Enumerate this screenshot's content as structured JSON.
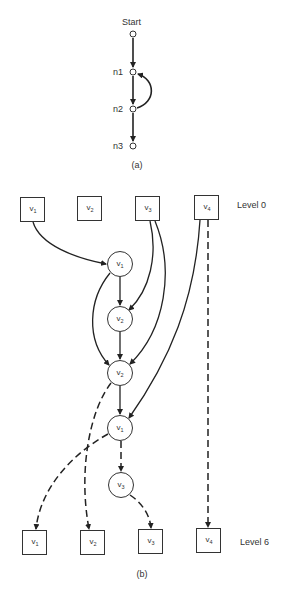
{
  "part_a": {
    "caption": "(a)",
    "nodes": [
      {
        "id": "start",
        "label": "Start",
        "x": 133,
        "y": 34
      },
      {
        "id": "n1",
        "label": "n1",
        "x": 133,
        "y": 72
      },
      {
        "id": "n2",
        "label": "n2",
        "x": 133,
        "y": 109
      },
      {
        "id": "n3",
        "label": "n3",
        "x": 133,
        "y": 146
      }
    ],
    "edges": [
      {
        "from": "start",
        "to": "n1",
        "style": "solid"
      },
      {
        "from": "n1",
        "to": "n2",
        "style": "solid"
      },
      {
        "from": "n2",
        "to": "n1",
        "style": "solid",
        "shape": "arc"
      },
      {
        "from": "n2",
        "to": "n3",
        "style": "solid"
      }
    ]
  },
  "part_b": {
    "caption": "(b)",
    "level_top_label": "Level 0",
    "level_bottom_label": "Level 6",
    "top_boxes": [
      {
        "id": "t1",
        "base": "v",
        "sub": "1"
      },
      {
        "id": "t2",
        "base": "v",
        "sub": "2"
      },
      {
        "id": "t3",
        "base": "v",
        "sub": "3"
      },
      {
        "id": "t4",
        "base": "v",
        "sub": "4"
      }
    ],
    "circles": [
      {
        "id": "c1",
        "base": "v",
        "sub": "1"
      },
      {
        "id": "c2",
        "base": "v",
        "sub": "2"
      },
      {
        "id": "c3",
        "base": "v",
        "sub": "2"
      },
      {
        "id": "c4",
        "base": "v",
        "sub": "1"
      },
      {
        "id": "c5",
        "base": "v",
        "sub": "3"
      }
    ],
    "bottom_boxes": [
      {
        "id": "b1",
        "base": "v",
        "sub": "1"
      },
      {
        "id": "b2",
        "base": "v",
        "sub": "2"
      },
      {
        "id": "b3",
        "base": "v",
        "sub": "3"
      },
      {
        "id": "b4",
        "base": "v",
        "sub": "4"
      }
    ],
    "edges": [
      {
        "from": "t1",
        "to": "c1",
        "style": "solid"
      },
      {
        "from": "c1",
        "to": "c2",
        "style": "solid"
      },
      {
        "from": "c1",
        "to": "c3",
        "style": "solid"
      },
      {
        "from": "t3",
        "to": "c2",
        "style": "solid"
      },
      {
        "from": "t3",
        "to": "c3",
        "style": "solid"
      },
      {
        "from": "c2",
        "to": "c3",
        "style": "solid"
      },
      {
        "from": "c3",
        "to": "c4",
        "style": "solid"
      },
      {
        "from": "t4",
        "to": "c4",
        "style": "solid"
      },
      {
        "from": "t4",
        "to": "b4",
        "style": "dashed"
      },
      {
        "from": "c3",
        "to": "b2",
        "style": "dashed"
      },
      {
        "from": "c4",
        "to": "b1",
        "style": "dashed"
      },
      {
        "from": "c4",
        "to": "c5",
        "style": "dashed"
      },
      {
        "from": "c5",
        "to": "b3",
        "style": "dashed"
      }
    ]
  }
}
